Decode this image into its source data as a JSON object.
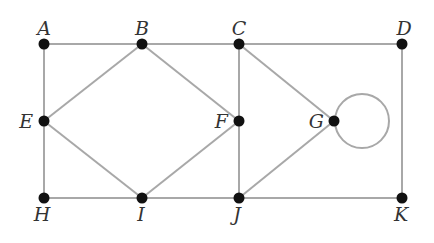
{
  "diagram": {
    "type": "graph",
    "colors": {
      "edge": "#a8a8a8",
      "node": "#111111",
      "label": "#333333",
      "background": "#ffffff"
    },
    "nodes": [
      {
        "id": "A",
        "label": "A",
        "x": 44,
        "y": 44,
        "lx": 44,
        "ly": 35,
        "anchor": "middle"
      },
      {
        "id": "B",
        "label": "B",
        "x": 142,
        "y": 44,
        "lx": 142,
        "ly": 35,
        "anchor": "middle"
      },
      {
        "id": "C",
        "label": "C",
        "x": 239,
        "y": 44,
        "lx": 239,
        "ly": 35,
        "anchor": "middle"
      },
      {
        "id": "D",
        "label": "D",
        "x": 402,
        "y": 44,
        "lx": 404,
        "ly": 35,
        "anchor": "middle"
      },
      {
        "id": "E",
        "label": "E",
        "x": 44,
        "y": 121,
        "lx": 33,
        "ly": 128,
        "anchor": "end"
      },
      {
        "id": "F",
        "label": "F",
        "x": 239,
        "y": 121,
        "lx": 228,
        "ly": 128,
        "anchor": "end"
      },
      {
        "id": "G",
        "label": "G",
        "x": 334,
        "y": 121,
        "lx": 324,
        "ly": 128,
        "anchor": "end"
      },
      {
        "id": "H",
        "label": "H",
        "x": 44,
        "y": 198,
        "lx": 42,
        "ly": 221,
        "anchor": "middle"
      },
      {
        "id": "I",
        "label": "I",
        "x": 142,
        "y": 198,
        "lx": 141,
        "ly": 221,
        "anchor": "middle"
      },
      {
        "id": "J",
        "label": "J",
        "x": 239,
        "y": 198,
        "lx": 237,
        "ly": 221,
        "anchor": "middle"
      },
      {
        "id": "K",
        "label": "K",
        "x": 402,
        "y": 198,
        "lx": 401,
        "ly": 221,
        "anchor": "middle"
      }
    ],
    "edges": [
      [
        "A",
        "B"
      ],
      [
        "B",
        "C"
      ],
      [
        "C",
        "D"
      ],
      [
        "A",
        "E"
      ],
      [
        "E",
        "H"
      ],
      [
        "B",
        "E"
      ],
      [
        "B",
        "F"
      ],
      [
        "E",
        "I"
      ],
      [
        "I",
        "F"
      ],
      [
        "C",
        "F"
      ],
      [
        "F",
        "J"
      ],
      [
        "C",
        "G"
      ],
      [
        "G",
        "J"
      ],
      [
        "D",
        "K"
      ],
      [
        "H",
        "I"
      ],
      [
        "I",
        "J"
      ],
      [
        "J",
        "K"
      ]
    ],
    "loops": [
      {
        "node": "G",
        "cx": 362,
        "cy": 121,
        "r": 27
      }
    ]
  }
}
